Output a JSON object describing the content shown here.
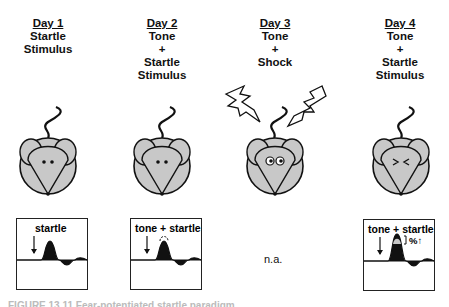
{
  "columns": [
    {
      "day": "Day 1",
      "lines": [
        "Startle",
        "Stimulus"
      ],
      "cx": 48,
      "mouse_state": "neutral",
      "panel": {
        "label": "startle",
        "type": "baseline"
      }
    },
    {
      "day": "Day 2",
      "lines": [
        "Tone",
        "+",
        "Startle",
        "Stimulus"
      ],
      "cx": 162,
      "mouse_state": "neutral",
      "panel": {
        "label": "tone + startle",
        "type": "no-change"
      }
    },
    {
      "day": "Day 3",
      "lines": [
        "Tone",
        "+",
        "Shock"
      ],
      "cx": 275,
      "mouse_state": "shocked",
      "panel": {
        "label": "n.a.",
        "type": "none"
      }
    },
    {
      "day": "Day 4",
      "lines": [
        "Tone",
        "+",
        "Startle",
        "Stimulus"
      ],
      "cx": 400,
      "mouse_state": "afraid",
      "panel": {
        "label": "tone + startle",
        "type": "potentiated",
        "annotation": "%↑"
      }
    }
  ],
  "caption": "FIGURE 13.11 Fear-potentiated startle paradigm"
}
